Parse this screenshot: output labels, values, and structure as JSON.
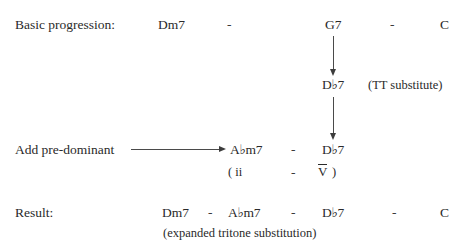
{
  "diagram": {
    "title": "Expanded tritone substitution",
    "background_color": "#ffffff",
    "text_color": "#2a2a2a",
    "arrow_color": "#4a4a4a"
  },
  "row_basic": {
    "label": "Basic progression:",
    "chord_1": "Dm7",
    "dash_1": "-",
    "chord_2": "G7",
    "dash_2": "-",
    "chord_3": "C"
  },
  "row_substitute": {
    "chord": "D♭7",
    "annotation": "(TT substitute)"
  },
  "row_predominant": {
    "label": "Add pre-dominant",
    "chord_1": "A♭m7",
    "dash_1": "-",
    "chord_2": "D♭7"
  },
  "row_roman": {
    "open_paren": "( ii",
    "dash": "-",
    "numeral": "V",
    "close_paren": ")"
  },
  "row_result": {
    "label": "Result:",
    "chord_1": "Dm7",
    "dash_1": "-",
    "chord_2": "A♭m7",
    "dash_2": "-",
    "chord_3": "D♭7",
    "dash_3": "-",
    "chord_4": "C",
    "caption": "(expanded tritone substitution)"
  },
  "arrows": {
    "g7_to_db7": "arrow-down",
    "db7_to_db7": "arrow-down",
    "predominant": "arrow-right"
  }
}
